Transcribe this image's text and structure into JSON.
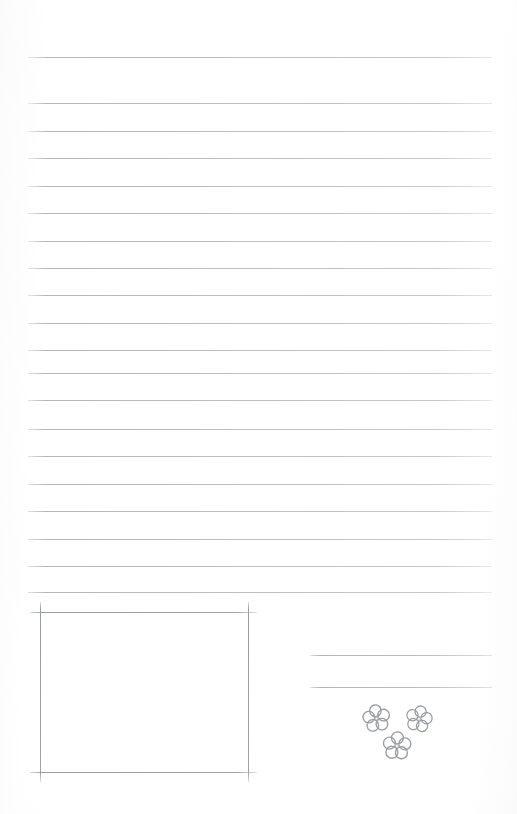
{
  "page": {
    "kind": "scanned-lined-journal-page",
    "width": 517,
    "height": 814,
    "background_color": "#ffffff",
    "rule_color": "#b4b6bc",
    "frame_color": "#989aa1",
    "doodle_color": "#9a9ca3",
    "doodle_center_color": "#b6b8be",
    "visible_text": ""
  },
  "ruled_lines": {
    "count": 20,
    "left_x": 28,
    "right_x": 492,
    "y_positions": [
      57,
      103,
      131,
      158,
      186,
      213,
      241,
      268,
      295,
      323,
      350,
      373,
      400,
      429,
      456,
      484,
      511,
      539,
      566,
      592
    ]
  },
  "photo_frame": {
    "name": "photo-frame-box",
    "left_x": 40,
    "right_x": 248,
    "top_y": 612,
    "bottom_y": 772,
    "vertical_overhang_top": 10,
    "vertical_overhang_bottom": 10,
    "horizontal_overhang_left": 10,
    "horizontal_overhang_right": 9
  },
  "side_lines": {
    "name": "caption-lines",
    "left_x": 310,
    "right_x": 492,
    "y_positions": [
      655,
      687
    ]
  },
  "flower_doodles": [
    {
      "name": "flower-doodle-left",
      "cx": 376,
      "cy": 718,
      "size": 29,
      "rotation": -8
    },
    {
      "name": "flower-doodle-right",
      "cx": 419,
      "cy": 719,
      "size": 28,
      "rotation": 12
    },
    {
      "name": "flower-doodle-bottom",
      "cx": 397,
      "cy": 746,
      "size": 30,
      "rotation": 3
    }
  ]
}
